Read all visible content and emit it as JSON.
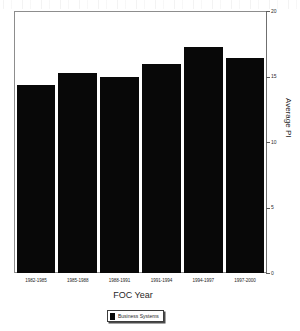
{
  "chart_data": {
    "type": "bar",
    "title": "",
    "xlabel": "FOC Year",
    "ylabel": "Average PI",
    "categories": [
      "1982-1985",
      "1985-1988",
      "1988-1991",
      "1991-1994",
      "1994-1997",
      "1997-2000"
    ],
    "values": [
      14.4,
      15.3,
      15.0,
      16.0,
      17.3,
      16.5
    ],
    "series": [
      {
        "name": "Business Systems",
        "color": "#080808",
        "values": [
          14.4,
          15.3,
          15.0,
          16.0,
          17.3,
          16.5
        ]
      }
    ],
    "ylim": [
      0,
      20
    ],
    "yticks": [
      0,
      5,
      10,
      15,
      20
    ],
    "ytick_labels": [
      "0",
      "5",
      "10",
      "15",
      "20"
    ],
    "y_axis_position": "right",
    "grid": false,
    "legend": {
      "position": "bottom",
      "entries": [
        {
          "label": "Business Systems",
          "color": "#080808"
        }
      ]
    }
  },
  "axes": {
    "x_title": "FOC Year",
    "y_title": "Average PI"
  },
  "legend": {
    "label": "Business Systems"
  },
  "colors": {
    "bar": "#080808",
    "frame": "#8d8d8d",
    "background": "#ffffff"
  }
}
